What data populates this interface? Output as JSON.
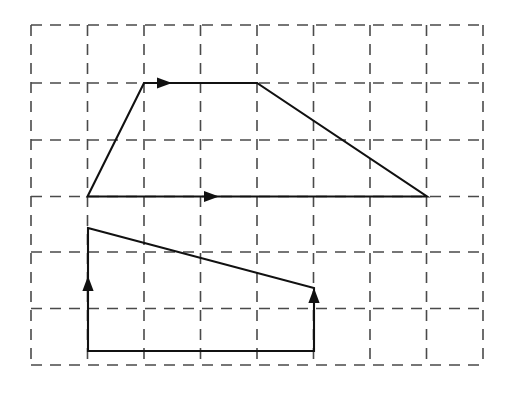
{
  "figure": {
    "canvas": {
      "width": 510,
      "height": 403
    },
    "background_color": "#ffffff"
  },
  "grid": {
    "label": "dashed-square-grid",
    "line_color": "#4a4a4a",
    "dash_pattern": "11 8",
    "stroke_width": 1.6,
    "origin_x": 31,
    "origin_y": 25,
    "cell_size": 56.5,
    "columns": 8,
    "rows": 6,
    "vertical_x": [
      31,
      87.5,
      144,
      200.5,
      257,
      313.5,
      370,
      426.5,
      483
    ],
    "horizontal_y": [
      25,
      83,
      140,
      196.5,
      252,
      308.5,
      365
    ]
  },
  "shapes": [
    {
      "name": "upper-trapezoid",
      "stroke_color": "#111111",
      "stroke_width": 2.1,
      "closed": true,
      "points": "87.5,196.5 144,83 257,83 427,196.5",
      "vertices": [
        {
          "label": "bottom-left",
          "x": 87.5,
          "y": 196.5,
          "grid": [
            1,
            3
          ]
        },
        {
          "label": "top-left",
          "x": 144,
          "y": 83,
          "grid": [
            2,
            1
          ]
        },
        {
          "label": "top-right",
          "x": 257,
          "y": 83,
          "grid": [
            4,
            1
          ]
        },
        {
          "label": "bottom-right",
          "x": 427,
          "y": 196.5,
          "grid": [
            7,
            3
          ]
        }
      ],
      "arrows": [
        {
          "name": "top-edge-arrow",
          "direction": "right",
          "x": 172,
          "y": 83
        },
        {
          "name": "bottom-edge-arrow",
          "direction": "right",
          "x": 219,
          "y": 196.5
        }
      ]
    },
    {
      "name": "lower-quadrilateral",
      "stroke_color": "#111111",
      "stroke_width": 2.1,
      "closed": true,
      "points": "88,228 314,288 314,351 88,351",
      "vertices": [
        {
          "label": "top-left",
          "x": 88,
          "y": 228,
          "grid": [
            1,
            3.59
          ]
        },
        {
          "label": "top-right",
          "x": 314,
          "y": 288,
          "grid": [
            5,
            4.65
          ]
        },
        {
          "label": "bottom-right",
          "x": 314,
          "y": 351,
          "grid": [
            5,
            5.77
          ]
        },
        {
          "label": "bottom-left",
          "x": 88,
          "y": 351,
          "grid": [
            1,
            5.77
          ]
        }
      ],
      "arrows": [
        {
          "name": "left-edge-arrow",
          "direction": "up",
          "x": 88,
          "y": 291
        },
        {
          "name": "right-edge-arrow",
          "direction": "up",
          "x": 314,
          "y": 303
        }
      ]
    }
  ]
}
